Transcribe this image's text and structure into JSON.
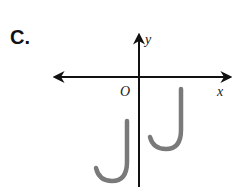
{
  "figure": {
    "label": "C.",
    "axes": {
      "x_label": "x",
      "y_label": "y",
      "origin_label": "O"
    },
    "shapes": [
      {
        "name": "original-j",
        "quadrant": "IV",
        "color": "#7a7a7a"
      },
      {
        "name": "translated-j",
        "quadrant": "III/IV",
        "color": "#7a7a7a"
      }
    ],
    "colors": {
      "axis": "#111111",
      "shape": "#7a7a7a"
    }
  }
}
